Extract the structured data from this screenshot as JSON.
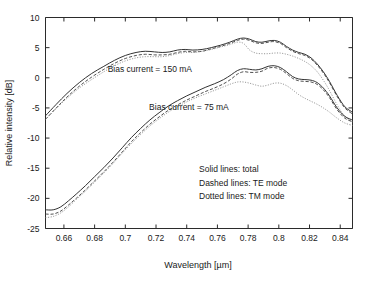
{
  "chart_data": {
    "type": "line",
    "title": "",
    "xlabel": "Wavelength [µm]",
    "ylabel": "Relative intensity [dB]",
    "xlim": [
      0.648,
      0.848
    ],
    "ylim": [
      -25,
      10
    ],
    "xticks": [
      0.66,
      0.68,
      0.7,
      0.72,
      0.74,
      0.76,
      0.78,
      0.8,
      0.82,
      0.84
    ],
    "xtick_labels": [
      "0.66",
      "0.68",
      "0.7",
      "0.72",
      "0.74",
      "0.76",
      "0.78",
      "0.8",
      "0.82",
      "0.84"
    ],
    "yticks": [
      -25,
      -20,
      -15,
      -10,
      -5,
      0,
      5,
      10
    ],
    "ytick_labels": [
      "-25",
      "-20",
      "-15",
      "-10",
      "-5",
      "0",
      "5",
      "10"
    ],
    "grid": false,
    "legend_position": "inside-lower-right",
    "legend_entries": [
      "Solid lines: total",
      "Dashed lines: TE mode",
      "Dotted lines: TM mode"
    ],
    "annotations": [
      {
        "text": "Bias current = 150 mA",
        "x": 0.6885,
        "y": 1.0
      },
      {
        "text": "Bias current = 75 mA",
        "x": 0.7155,
        "y": -5.3
      }
    ],
    "series": [
      {
        "name": "150 mA total",
        "style": "solid",
        "color": "#333333",
        "x": [
          0.648,
          0.655,
          0.662,
          0.67,
          0.678,
          0.686,
          0.693,
          0.7,
          0.707,
          0.713,
          0.719,
          0.724,
          0.729,
          0.734,
          0.739,
          0.744,
          0.75,
          0.756,
          0.762,
          0.768,
          0.773,
          0.777,
          0.781,
          0.785,
          0.789,
          0.793,
          0.797,
          0.801,
          0.805,
          0.809,
          0.813,
          0.817,
          0.821,
          0.825,
          0.829,
          0.833,
          0.838,
          0.843,
          0.848
        ],
        "values": [
          -6.3,
          -4.4,
          -2.6,
          -0.8,
          0.7,
          1.9,
          2.9,
          3.7,
          4.2,
          4.4,
          4.3,
          4.2,
          4.3,
          4.6,
          4.7,
          4.6,
          4.7,
          5.0,
          5.4,
          5.9,
          6.4,
          6.6,
          6.4,
          6.0,
          5.9,
          6.1,
          6.2,
          5.9,
          5.2,
          4.6,
          4.2,
          3.9,
          3.3,
          2.3,
          1.0,
          -0.6,
          -2.9,
          -4.8,
          -5.7
        ]
      },
      {
        "name": "150 mA TE mode",
        "style": "dashed",
        "color": "#3d3d3d",
        "x": [
          0.648,
          0.655,
          0.662,
          0.67,
          0.678,
          0.686,
          0.693,
          0.7,
          0.707,
          0.713,
          0.719,
          0.724,
          0.729,
          0.734,
          0.739,
          0.744,
          0.75,
          0.756,
          0.762,
          0.768,
          0.773,
          0.777,
          0.781,
          0.785,
          0.789,
          0.793,
          0.797,
          0.801,
          0.805,
          0.809,
          0.813,
          0.817,
          0.821,
          0.825,
          0.829,
          0.833,
          0.838,
          0.843,
          0.848
        ],
        "values": [
          -6.9,
          -5.0,
          -3.2,
          -1.4,
          0.1,
          1.4,
          2.4,
          3.2,
          3.7,
          3.9,
          3.8,
          3.8,
          3.9,
          4.2,
          4.4,
          4.3,
          4.4,
          4.8,
          5.2,
          5.7,
          6.2,
          6.4,
          6.2,
          5.8,
          5.7,
          5.9,
          6.0,
          5.7,
          5.0,
          4.4,
          4.0,
          3.7,
          3.1,
          2.1,
          0.8,
          -0.8,
          -3.1,
          -5.0,
          -6.0
        ]
      },
      {
        "name": "150 mA TM mode",
        "style": "dotted",
        "color": "#8a8a8a",
        "x": [
          0.648,
          0.655,
          0.662,
          0.67,
          0.678,
          0.686,
          0.693,
          0.7,
          0.707,
          0.713,
          0.719,
          0.724,
          0.729,
          0.734,
          0.739,
          0.744,
          0.75,
          0.756,
          0.762,
          0.768,
          0.773,
          0.777,
          0.781,
          0.785,
          0.789,
          0.793,
          0.797,
          0.801,
          0.805,
          0.809,
          0.813,
          0.817,
          0.821,
          0.825,
          0.829,
          0.833,
          0.838,
          0.843,
          0.848
        ],
        "values": [
          -6.9,
          -5.1,
          -3.4,
          -1.7,
          -0.3,
          1.0,
          2.0,
          2.8,
          3.3,
          3.5,
          3.5,
          3.5,
          3.7,
          4.0,
          4.2,
          4.2,
          4.4,
          4.7,
          5.1,
          5.5,
          5.9,
          5.7,
          4.6,
          4.1,
          4.0,
          4.0,
          4.1,
          4.1,
          3.9,
          3.6,
          3.2,
          2.7,
          2.0,
          1.0,
          -0.4,
          -2.1,
          -4.5,
          -6.4,
          -7.3
        ]
      },
      {
        "name": "75 mA total",
        "style": "solid",
        "color": "#333333",
        "x": [
          0.648,
          0.653,
          0.658,
          0.663,
          0.668,
          0.674,
          0.68,
          0.686,
          0.692,
          0.698,
          0.704,
          0.71,
          0.716,
          0.722,
          0.728,
          0.734,
          0.74,
          0.746,
          0.752,
          0.758,
          0.764,
          0.769,
          0.773,
          0.777,
          0.781,
          0.785,
          0.789,
          0.793,
          0.797,
          0.801,
          0.805,
          0.809,
          0.813,
          0.817,
          0.821,
          0.825,
          0.829,
          0.833,
          0.838,
          0.843,
          0.848
        ],
        "values": [
          -21.9,
          -21.9,
          -21.4,
          -20.4,
          -19.3,
          -17.9,
          -16.4,
          -14.9,
          -13.3,
          -11.6,
          -9.9,
          -8.4,
          -7.0,
          -5.8,
          -4.7,
          -3.8,
          -3.0,
          -2.3,
          -1.6,
          -1.0,
          -0.3,
          0.5,
          1.2,
          1.5,
          1.4,
          1.3,
          1.5,
          1.9,
          2.0,
          1.7,
          1.0,
          0.2,
          -0.2,
          -0.3,
          -0.4,
          -0.8,
          -1.7,
          -3.0,
          -5.0,
          -6.4,
          -7.0
        ]
      },
      {
        "name": "75 mA TE mode",
        "style": "dashed",
        "color": "#3d3d3d",
        "x": [
          0.648,
          0.653,
          0.658,
          0.663,
          0.668,
          0.674,
          0.68,
          0.686,
          0.692,
          0.698,
          0.704,
          0.71,
          0.716,
          0.722,
          0.728,
          0.734,
          0.74,
          0.746,
          0.752,
          0.758,
          0.764,
          0.769,
          0.773,
          0.777,
          0.781,
          0.785,
          0.789,
          0.793,
          0.797,
          0.801,
          0.805,
          0.809,
          0.813,
          0.817,
          0.821,
          0.825,
          0.829,
          0.833,
          0.838,
          0.843,
          0.848
        ],
        "values": [
          -22.6,
          -22.6,
          -22.1,
          -21.1,
          -20.0,
          -18.6,
          -17.1,
          -15.6,
          -14.0,
          -12.3,
          -10.6,
          -9.1,
          -7.7,
          -6.5,
          -5.4,
          -4.5,
          -3.7,
          -3.0,
          -2.3,
          -1.7,
          -1.0,
          -0.2,
          0.6,
          1.0,
          0.9,
          0.9,
          1.1,
          1.6,
          1.7,
          1.4,
          0.7,
          -0.1,
          -0.5,
          -0.6,
          -0.7,
          -1.1,
          -2.0,
          -3.3,
          -5.3,
          -6.7,
          -7.3
        ]
      },
      {
        "name": "75 mA TM mode",
        "style": "dotted",
        "color": "#8a8a8a",
        "x": [
          0.648,
          0.653,
          0.658,
          0.663,
          0.668,
          0.674,
          0.68,
          0.686,
          0.692,
          0.698,
          0.704,
          0.71,
          0.716,
          0.722,
          0.728,
          0.734,
          0.74,
          0.746,
          0.752,
          0.758,
          0.764,
          0.769,
          0.773,
          0.777,
          0.781,
          0.785,
          0.789,
          0.793,
          0.797,
          0.801,
          0.805,
          0.809,
          0.813,
          0.817,
          0.821,
          0.825,
          0.829,
          0.833,
          0.838,
          0.843,
          0.848
        ],
        "values": [
          -23.2,
          -23.0,
          -22.4,
          -21.4,
          -20.2,
          -18.8,
          -17.3,
          -15.8,
          -14.2,
          -12.5,
          -10.9,
          -9.4,
          -8.0,
          -6.8,
          -5.7,
          -4.8,
          -4.0,
          -3.3,
          -2.7,
          -2.1,
          -1.5,
          -1.0,
          -0.7,
          -0.7,
          -0.9,
          -1.2,
          -1.4,
          -1.2,
          -0.9,
          -0.9,
          -1.3,
          -2.0,
          -2.8,
          -3.4,
          -3.9,
          -4.4,
          -5.0,
          -5.7,
          -6.7,
          -7.5,
          -7.9
        ]
      }
    ]
  },
  "figure": {
    "background_color": "#ffffff",
    "axis_color": "#2b2b2b"
  }
}
